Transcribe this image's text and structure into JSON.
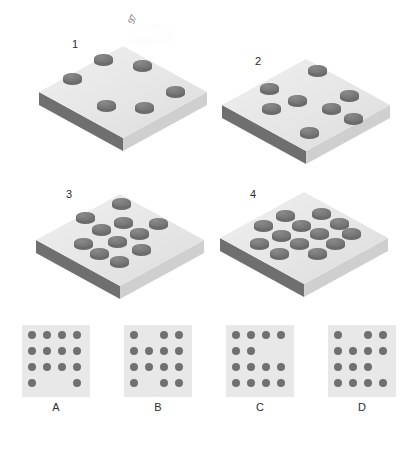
{
  "figure": {
    "type": "visual-pattern-sequence-puzzle",
    "watermark_text": "97",
    "background_color": "#ffffff",
    "slab_top_color": "#e7e7e7",
    "slab_edge_color": "#6f6f6f",
    "cylinder_color": "#707070",
    "option_tile_color": "#e8e8e8",
    "label_color": "#2d2d2d"
  },
  "sequence": {
    "panels": [
      {
        "number": "1",
        "cylinder_count": 6,
        "number_pos": {
          "x": 72,
          "y": 38
        },
        "panel_pos": {
          "x": 35,
          "y": 42
        },
        "cylinders": [
          {
            "x": 59,
            "y": 12
          },
          {
            "x": 98,
            "y": 18
          },
          {
            "x": 28,
            "y": 31
          },
          {
            "x": 131,
            "y": 44
          },
          {
            "x": 62,
            "y": 58
          },
          {
            "x": 100,
            "y": 60
          }
        ]
      },
      {
        "number": "2",
        "cylinder_count": 8,
        "number_pos": {
          "x": 255,
          "y": 55
        },
        "panel_pos": {
          "x": 218,
          "y": 55
        },
        "cylinders": [
          {
            "x": 90,
            "y": 10
          },
          {
            "x": 42,
            "y": 28
          },
          {
            "x": 122,
            "y": 35
          },
          {
            "x": 70,
            "y": 40
          },
          {
            "x": 44,
            "y": 48
          },
          {
            "x": 104,
            "y": 48
          },
          {
            "x": 126,
            "y": 58
          },
          {
            "x": 82,
            "y": 72
          }
        ]
      },
      {
        "number": "3",
        "cylinder_count": 11,
        "number_pos": {
          "x": 66,
          "y": 188
        },
        "panel_pos": {
          "x": 32,
          "y": 190
        },
        "cylinders": [
          {
            "x": 80,
            "y": 8
          },
          {
            "x": 44,
            "y": 22
          },
          {
            "x": 82,
            "y": 27
          },
          {
            "x": 117,
            "y": 28
          },
          {
            "x": 60,
            "y": 34
          },
          {
            "x": 98,
            "y": 38
          },
          {
            "x": 76,
            "y": 46
          },
          {
            "x": 42,
            "y": 48
          },
          {
            "x": 100,
            "y": 54
          },
          {
            "x": 58,
            "y": 58
          },
          {
            "x": 78,
            "y": 66
          }
        ]
      },
      {
        "number": "4",
        "cylinder_count": 13,
        "number_pos": {
          "x": 250,
          "y": 188
        },
        "panel_pos": {
          "x": 216,
          "y": 188
        },
        "cylinders": [
          {
            "x": 60,
            "y": 22
          },
          {
            "x": 96,
            "y": 20
          },
          {
            "x": 38,
            "y": 32
          },
          {
            "x": 76,
            "y": 32
          },
          {
            "x": 114,
            "y": 30
          },
          {
            "x": 56,
            "y": 42
          },
          {
            "x": 94,
            "y": 40
          },
          {
            "x": 126,
            "y": 40
          },
          {
            "x": 34,
            "y": 50
          },
          {
            "x": 74,
            "y": 50
          },
          {
            "x": 110,
            "y": 50
          },
          {
            "x": 54,
            "y": 60
          },
          {
            "x": 92,
            "y": 60
          }
        ]
      }
    ]
  },
  "options": {
    "grid_rows": 4,
    "grid_cols": 4,
    "items": [
      {
        "label": "A",
        "pos_x": 22,
        "dot_count": 14,
        "rows": [
          [
            1,
            1,
            1,
            1
          ],
          [
            1,
            1,
            1,
            1
          ],
          [
            1,
            1,
            1,
            1
          ],
          [
            1,
            0,
            0,
            1
          ]
        ]
      },
      {
        "label": "B",
        "pos_x": 124,
        "dot_count": 14,
        "rows": [
          [
            1,
            0,
            1,
            1
          ],
          [
            1,
            1,
            1,
            1
          ],
          [
            1,
            1,
            1,
            1
          ],
          [
            1,
            0,
            1,
            1
          ]
        ]
      },
      {
        "label": "C",
        "pos_x": 226,
        "dot_count": 14,
        "rows": [
          [
            1,
            1,
            1,
            1
          ],
          [
            1,
            1,
            0,
            0
          ],
          [
            1,
            1,
            1,
            1
          ],
          [
            1,
            1,
            1,
            1
          ]
        ]
      },
      {
        "label": "D",
        "pos_x": 328,
        "dot_count": 14,
        "rows": [
          [
            1,
            0,
            1,
            1
          ],
          [
            1,
            1,
            1,
            1
          ],
          [
            1,
            1,
            1,
            0
          ],
          [
            1,
            1,
            1,
            1
          ]
        ]
      }
    ]
  }
}
